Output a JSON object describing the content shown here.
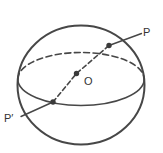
{
  "figure": {
    "labels": {
      "p": "P",
      "o": "O",
      "p_prime": "P′"
    },
    "colors": {
      "ink": "#474747",
      "point_fill": "#3a3a3a",
      "label_text": "#333333",
      "background": "#ffffff"
    }
  }
}
